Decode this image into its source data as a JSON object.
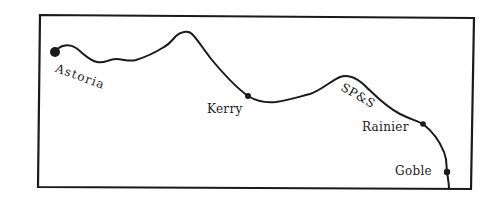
{
  "map": {
    "type": "railroad route sketch map",
    "line_color": "#1a1a1a",
    "background": "#ffffff",
    "railroad": {
      "label": "SP&S"
    },
    "towns": [
      {
        "name": "Astoria",
        "marker": "large-dot"
      },
      {
        "name": "Kerry",
        "marker": "dot"
      },
      {
        "name": "Rainier",
        "marker": "dot"
      },
      {
        "name": "Goble",
        "marker": "dot"
      }
    ]
  }
}
